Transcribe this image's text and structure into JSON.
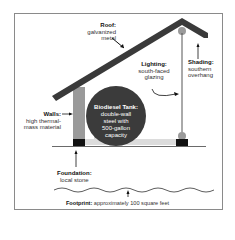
{
  "diagram": {
    "colors": {
      "roof": "#3a3a3a",
      "wall": "#9a9a9a",
      "tank": "#3b3b3b",
      "foundation": "#111111",
      "frame_border": "#8a8a8a",
      "light_wall": "#d8d8d8"
    },
    "labels": {
      "roof": {
        "title": "Roof:",
        "desc_1": "galvanized",
        "desc_2": "metal"
      },
      "lighting": {
        "title": "Lighting:",
        "desc_1": "south-faced",
        "desc_2": "glazing"
      },
      "shading": {
        "title": "Shading:",
        "desc_1": "southern",
        "desc_2": "overhang"
      },
      "walls": {
        "title": "Walls:",
        "desc_1": "high thermal-",
        "desc_2": "mass material"
      },
      "tank": {
        "title": "Biodiesel Tank:",
        "desc_1": "double-wall",
        "desc_2": "steel with",
        "desc_3": "500-gallon",
        "desc_4": "capacity"
      },
      "foundation": {
        "title": "Foundation:",
        "desc_1": "local stone"
      },
      "footprint": {
        "title": "Footprint:",
        "desc": "approximately 100 square feet"
      }
    }
  }
}
